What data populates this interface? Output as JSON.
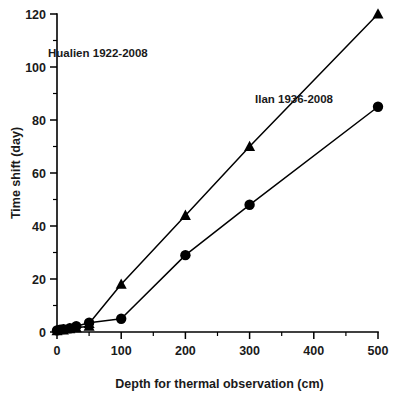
{
  "chart_data": {
    "type": "line",
    "title": "",
    "xlabel": "Depth for thermal observation (cm)",
    "ylabel": "Time shift (day)",
    "xlim": [
      0,
      500
    ],
    "ylim": [
      0,
      120
    ],
    "xticks": [
      0,
      100,
      200,
      300,
      400,
      500
    ],
    "xticks_minor": [
      50,
      150,
      250,
      350,
      450
    ],
    "yticks": [
      0,
      20,
      40,
      60,
      80,
      100,
      120
    ],
    "yticks_minor": [
      10,
      30,
      50,
      70,
      90,
      110
    ],
    "grid": false,
    "legend_position": "inline-annotation",
    "marker_color": "#000000",
    "line_color": "#000000",
    "series": [
      {
        "name": "Ilan 1936-2008",
        "marker": "triangle",
        "label_x": 255,
        "label_y": 103,
        "points": [
          {
            "x": 0,
            "y": 0.5
          },
          {
            "x": 10,
            "y": 0.8
          },
          {
            "x": 20,
            "y": 1.2
          },
          {
            "x": 30,
            "y": 1.6
          },
          {
            "x": 50,
            "y": 2.2
          },
          {
            "x": 50,
            "y": 3.2
          },
          {
            "x": 100,
            "y": 18
          },
          {
            "x": 200,
            "y": 44
          },
          {
            "x": 300,
            "y": 70
          },
          {
            "x": 500,
            "y": 120
          }
        ]
      },
      {
        "name": "Hualien 1922-2008",
        "marker": "circle",
        "label_x": 48,
        "label_y": 57,
        "points": [
          {
            "x": 0,
            "y": 0.6
          },
          {
            "x": 5,
            "y": 0.9
          },
          {
            "x": 10,
            "y": 1.1
          },
          {
            "x": 20,
            "y": 1.4
          },
          {
            "x": 30,
            "y": 2.2
          },
          {
            "x": 50,
            "y": 3.5
          },
          {
            "x": 100,
            "y": 5.0
          },
          {
            "x": 200,
            "y": 29
          },
          {
            "x": 300,
            "y": 48
          },
          {
            "x": 500,
            "y": 85
          }
        ]
      }
    ]
  },
  "axes": {
    "x_tick_labels": [
      "0",
      "100",
      "200",
      "300",
      "400",
      "500"
    ],
    "y_tick_labels": [
      "0",
      "20",
      "40",
      "60",
      "80",
      "100",
      "120"
    ],
    "x_axis_title": "Depth for thermal observation (cm)",
    "y_axis_title": "Time shift (day)"
  },
  "annotations": {
    "ilan_label": "Ilan 1936-2008",
    "hualien_label": "Hualien 1922-2008"
  }
}
